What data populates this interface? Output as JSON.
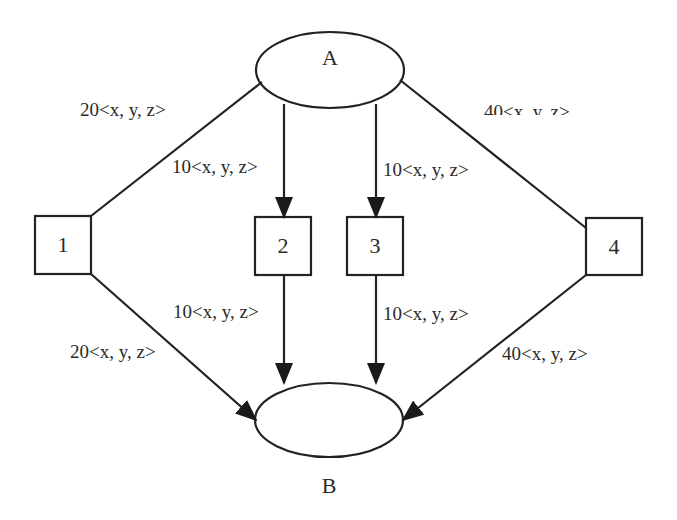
{
  "nodes": {
    "A": {
      "label": "A",
      "shape": "ellipse"
    },
    "B": {
      "label": "B",
      "shape": "ellipse"
    },
    "t1": {
      "label": "1",
      "shape": "box"
    },
    "t2": {
      "label": "2",
      "shape": "box"
    },
    "t3": {
      "label": "3",
      "shape": "box"
    },
    "t4": {
      "label": "4",
      "shape": "box"
    }
  },
  "edges": [
    {
      "from": "A",
      "to": "1",
      "label": "20<x, y, z>"
    },
    {
      "from": "A",
      "to": "2",
      "label": "10<x, y, z>"
    },
    {
      "from": "A",
      "to": "3",
      "label": "10<x, y, z>"
    },
    {
      "from": "A",
      "to": "4",
      "label": "40<x, y, z>"
    },
    {
      "from": "1",
      "to": "B",
      "label": "20<x, y, z>"
    },
    {
      "from": "2",
      "to": "B",
      "label": "10<x, y, z>"
    },
    {
      "from": "3",
      "to": "B",
      "label": "10<x, y, z>"
    },
    {
      "from": "4",
      "to": "B",
      "label": "40<x, y, z>"
    }
  ],
  "colors": {
    "stroke": "#222222",
    "background": "#ffffff"
  }
}
